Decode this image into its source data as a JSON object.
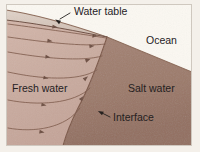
{
  "figure": {
    "kind": "geologic-cross-section",
    "width": 200,
    "height": 152
  },
  "colors": {
    "page_background": "#ffffff",
    "figure_margin": "#f4f0ea",
    "unsaturated_zone": "#d9cabf",
    "fresh_water": "#c9ab9f",
    "fresh_water_light": "#d2b5a9",
    "salt_water": "#9c7a6a",
    "salt_water_dark": "#8e6d5e",
    "ocean": "#fbf8f2",
    "line": "#6b4a3c",
    "label_text": "#25211f",
    "border": "#cfc8bf"
  },
  "labels": {
    "water_table": "Water table",
    "ocean": "Ocean",
    "fresh_water": "Fresh water",
    "salt_water": "Salt water",
    "interface": "Interface"
  },
  "annotations": {
    "water_table_leader": {
      "text_anchor_x": 73,
      "text_anchor_y": 12,
      "arrow_tip_x": 57,
      "arrow_tip_y": 22
    },
    "interface_leader": {
      "text_anchor_x": 113,
      "text_anchor_y": 118,
      "arrow_tip_x": 100,
      "arrow_tip_y": 113
    }
  },
  "geometry": {
    "land_surface": "M 8,12 C 40,17 78,28 107,37 L 192,72",
    "water_table": "M 8,20 C 42,24 80,32 107,37",
    "shoreline_x": 107,
    "shoreline_y": 37,
    "interface": "M 107,37 C 101,55 92,82 78,108 C 71,122 66,134 63,146",
    "ocean_surface": "M 107,37 L 192,37",
    "ocean_floor": "M 107,37 L 192,72"
  },
  "flow_lines": [
    {
      "id": "flowline-1",
      "path": "M 8,24 C 45,29 82,34 106,38"
    },
    {
      "id": "flowline-2",
      "path": "M 8,37 C 44,42 84,47 105,44"
    },
    {
      "id": "flowline-3",
      "path": "M 8,52 C 42,58 82,62 102,56"
    },
    {
      "id": "flowline-4",
      "path": "M 8,72 C 40,79 78,82 97,70"
    },
    {
      "id": "flowline-5",
      "path": "M 8,100 C 38,106 74,104 90,88"
    },
    {
      "id": "flowline-6",
      "path": "M 8,128 C 34,133 66,128 80,108"
    }
  ],
  "flow_markers": [
    {
      "x": 55,
      "y": 27,
      "angle": 8
    },
    {
      "x": 95,
      "y": 36,
      "angle": 2
    },
    {
      "x": 50,
      "y": 41,
      "angle": 8
    },
    {
      "x": 92,
      "y": 46,
      "angle": -8
    },
    {
      "x": 48,
      "y": 57,
      "angle": 9
    },
    {
      "x": 88,
      "y": 60,
      "angle": -20
    },
    {
      "x": 46,
      "y": 78,
      "angle": 11
    },
    {
      "x": 86,
      "y": 78,
      "angle": -40
    },
    {
      "x": 44,
      "y": 105,
      "angle": 11
    },
    {
      "x": 82,
      "y": 98,
      "angle": -52
    },
    {
      "x": 42,
      "y": 132,
      "angle": 10
    }
  ]
}
